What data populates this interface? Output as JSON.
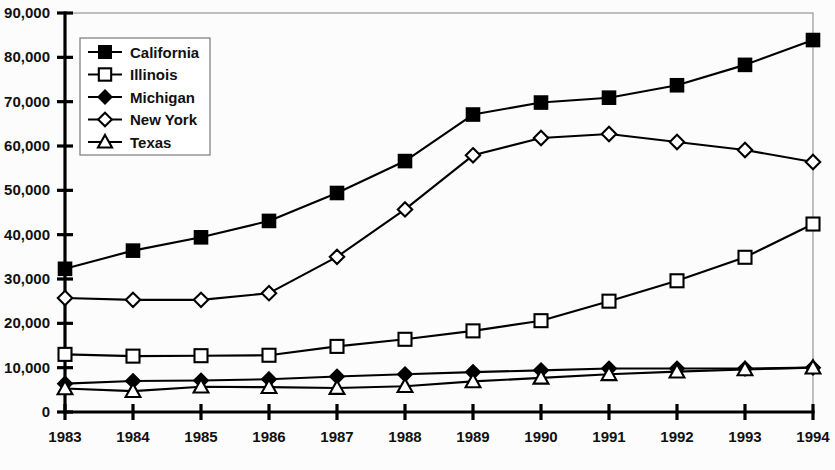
{
  "chart_data": {
    "type": "line",
    "title": "",
    "xlabel": "",
    "ylabel": "",
    "categories": [
      "1983",
      "1984",
      "1985",
      "1986",
      "1987",
      "1988",
      "1989",
      "1990",
      "1991",
      "1992",
      "1993",
      "1994"
    ],
    "ylim": [
      0,
      90000
    ],
    "ytick_values": [
      0,
      10000,
      20000,
      30000,
      40000,
      50000,
      60000,
      70000,
      80000,
      90000
    ],
    "ytick_labels": [
      "0",
      "10,000",
      "20,000",
      "30,000",
      "40,000",
      "50,000",
      "60,000",
      "70,000",
      "80,000",
      "90,000"
    ],
    "grid": false,
    "legend_position": "upper-left-inside",
    "series": [
      {
        "name": "California",
        "marker": "filled-square",
        "values": [
          32300,
          36400,
          39400,
          43100,
          49400,
          56600,
          67100,
          69800,
          70900,
          73700,
          78300,
          83900
        ]
      },
      {
        "name": "Illinois",
        "marker": "open-square",
        "values": [
          13000,
          12600,
          12700,
          12800,
          14800,
          16400,
          18300,
          20600,
          25000,
          29600,
          34900,
          42400
        ]
      },
      {
        "name": "Michigan",
        "marker": "filled-diamond",
        "values": [
          6400,
          7000,
          7100,
          7400,
          8000,
          8500,
          9000,
          9400,
          9800,
          9800,
          9800,
          10000
        ]
      },
      {
        "name": "New York",
        "marker": "open-diamond",
        "values": [
          25700,
          25300,
          25300,
          26800,
          35000,
          45700,
          57900,
          61800,
          62700,
          60900,
          59100,
          56400
        ]
      },
      {
        "name": "Texas",
        "marker": "open-triangle",
        "values": [
          5300,
          4700,
          5700,
          5600,
          5400,
          5800,
          6900,
          7700,
          8500,
          9100,
          9600,
          10000
        ]
      }
    ]
  },
  "legend": {
    "entries": [
      {
        "label": "California"
      },
      {
        "label": "Illinois"
      },
      {
        "label": "Michigan"
      },
      {
        "label": "New York"
      },
      {
        "label": "Texas"
      }
    ]
  },
  "colors": {
    "ink": "#000000",
    "background": "#fcfcfc",
    "frame": "#8d8d8d"
  }
}
